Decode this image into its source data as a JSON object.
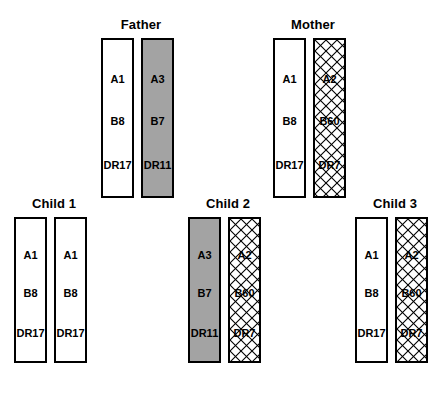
{
  "figure": {
    "title": "",
    "background_color": "#ffffff",
    "fill_colors": {
      "white": "#ffffff",
      "gray": "#a3a3a3",
      "hatch_line": "#000000",
      "outline": "#000000"
    },
    "loci": [
      "A",
      "B",
      "DR"
    ]
  },
  "people": [
    {
      "id": "father",
      "label": "Father",
      "haplotypes": [
        {
          "id": "father-hap-1",
          "fill": "white",
          "alleles": {
            "a": "A1",
            "b": "B8",
            "dr": "DR17"
          }
        },
        {
          "id": "father-hap-2",
          "fill": "gray",
          "alleles": {
            "a": "A3",
            "b": "B7",
            "dr": "DR11"
          }
        }
      ]
    },
    {
      "id": "mother",
      "label": "Mother",
      "haplotypes": [
        {
          "id": "mother-hap-1",
          "fill": "white",
          "alleles": {
            "a": "A1",
            "b": "B8",
            "dr": "DR17"
          }
        },
        {
          "id": "mother-hap-2",
          "fill": "hatch",
          "alleles": {
            "a": "A2",
            "b": "B60",
            "dr": "DR7"
          }
        }
      ]
    },
    {
      "id": "child-1",
      "label": "Child 1",
      "haplotypes": [
        {
          "id": "child-1-hap-1",
          "fill": "white",
          "alleles": {
            "a": "A1",
            "b": "B8",
            "dr": "DR17"
          }
        },
        {
          "id": "child-1-hap-2",
          "fill": "white",
          "alleles": {
            "a": "A1",
            "b": "B8",
            "dr": "DR17"
          }
        }
      ]
    },
    {
      "id": "child-2",
      "label": "Child 2",
      "haplotypes": [
        {
          "id": "child-2-hap-1",
          "fill": "gray",
          "alleles": {
            "a": "A3",
            "b": "B7",
            "dr": "DR11"
          }
        },
        {
          "id": "child-2-hap-2",
          "fill": "hatch",
          "alleles": {
            "a": "A2",
            "b": "B60",
            "dr": "DR7"
          }
        }
      ]
    },
    {
      "id": "child-3",
      "label": "Child 3",
      "haplotypes": [
        {
          "id": "child-3-hap-1",
          "fill": "white",
          "alleles": {
            "a": "A1",
            "b": "B8",
            "dr": "DR17"
          }
        },
        {
          "id": "child-3-hap-2",
          "fill": "hatch",
          "alleles": {
            "a": "A2",
            "b": "B60",
            "dr": "DR7"
          }
        }
      ]
    }
  ]
}
